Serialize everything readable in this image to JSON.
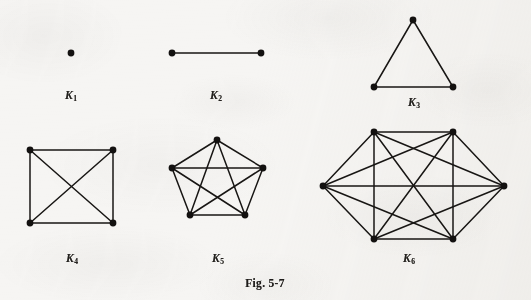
{
  "figure": {
    "caption": "Fig. 5-7",
    "background_color": "#f6f5f3",
    "ink_color": "#181614",
    "width": 531,
    "height": 300
  },
  "graphs": [
    {
      "id": "k1",
      "label_text": "K",
      "label_sub": "1",
      "name": "complete-graph-k1",
      "vertex_count": 1,
      "edge_count": 0,
      "label_x": 71,
      "label_y": 89,
      "vertices": [
        {
          "x": 71,
          "y": 53
        }
      ],
      "edges": []
    },
    {
      "id": "k2",
      "label_text": "K",
      "label_sub": "2",
      "name": "complete-graph-k2",
      "vertex_count": 2,
      "edge_count": 1,
      "label_x": 216,
      "label_y": 89,
      "vertices": [
        {
          "x": 172,
          "y": 53
        },
        {
          "x": 261,
          "y": 53
        }
      ],
      "edges": [
        [
          0,
          1
        ]
      ]
    },
    {
      "id": "k3",
      "label_text": "K",
      "label_sub": "3",
      "name": "complete-graph-k3",
      "vertex_count": 3,
      "edge_count": 3,
      "label_x": 414,
      "label_y": 96,
      "vertices": [
        {
          "x": 413,
          "y": 20
        },
        {
          "x": 374,
          "y": 87
        },
        {
          "x": 453,
          "y": 87
        }
      ],
      "edges": [
        [
          0,
          1
        ],
        [
          0,
          2
        ],
        [
          1,
          2
        ]
      ]
    },
    {
      "id": "k4",
      "label_text": "K",
      "label_sub": "4",
      "name": "complete-graph-k4",
      "vertex_count": 4,
      "edge_count": 6,
      "label_x": 72,
      "label_y": 252,
      "vertices": [
        {
          "x": 30,
          "y": 150
        },
        {
          "x": 113,
          "y": 150
        },
        {
          "x": 113,
          "y": 223
        },
        {
          "x": 30,
          "y": 223
        }
      ],
      "edges": [
        [
          0,
          1
        ],
        [
          1,
          2
        ],
        [
          2,
          3
        ],
        [
          3,
          0
        ],
        [
          0,
          2
        ],
        [
          1,
          3
        ]
      ]
    },
    {
      "id": "k5",
      "label_text": "K",
      "label_sub": "5",
      "name": "complete-graph-k5",
      "vertex_count": 5,
      "edge_count": 10,
      "label_x": 218,
      "label_y": 252,
      "vertices": [
        {
          "x": 217,
          "y": 140
        },
        {
          "x": 263,
          "y": 168
        },
        {
          "x": 245,
          "y": 215
        },
        {
          "x": 190,
          "y": 215
        },
        {
          "x": 172,
          "y": 168
        }
      ],
      "edges": [
        [
          0,
          1
        ],
        [
          1,
          2
        ],
        [
          2,
          3
        ],
        [
          3,
          4
        ],
        [
          4,
          0
        ],
        [
          0,
          2
        ],
        [
          0,
          3
        ],
        [
          1,
          3
        ],
        [
          1,
          4
        ],
        [
          2,
          4
        ]
      ]
    },
    {
      "id": "k6",
      "label_text": "K",
      "label_sub": "6",
      "name": "complete-graph-k6",
      "vertex_count": 6,
      "edge_count": 15,
      "label_x": 409,
      "label_y": 252,
      "vertices": [
        {
          "x": 374,
          "y": 132
        },
        {
          "x": 453,
          "y": 132
        },
        {
          "x": 504,
          "y": 186
        },
        {
          "x": 453,
          "y": 239
        },
        {
          "x": 374,
          "y": 239
        },
        {
          "x": 323,
          "y": 186
        }
      ],
      "edges": [
        [
          0,
          1
        ],
        [
          1,
          2
        ],
        [
          2,
          3
        ],
        [
          3,
          4
        ],
        [
          4,
          5
        ],
        [
          5,
          0
        ],
        [
          0,
          2
        ],
        [
          0,
          3
        ],
        [
          0,
          4
        ],
        [
          1,
          3
        ],
        [
          1,
          4
        ],
        [
          1,
          5
        ],
        [
          2,
          4
        ],
        [
          2,
          5
        ],
        [
          3,
          5
        ]
      ]
    }
  ]
}
